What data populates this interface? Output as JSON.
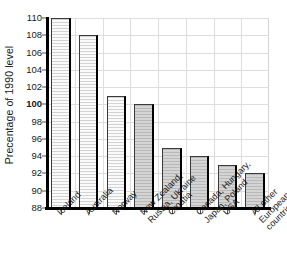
{
  "chart_data": {
    "type": "bar",
    "title": "",
    "xlabel": "",
    "ylabel": "Precentage of 1990 level",
    "ylim": [
      88,
      110
    ],
    "ytick_interval": 2,
    "yticks": [
      88,
      90,
      92,
      94,
      96,
      98,
      100,
      102,
      104,
      106,
      108,
      110
    ],
    "ytick_labels": [
      "88",
      "90",
      "92",
      "94",
      "96",
      "98",
      "100",
      "102",
      "104",
      "106",
      "108",
      "110"
    ],
    "emphasized_ytick": "100",
    "grid": true,
    "legend": "none",
    "categories": [
      "Iceland",
      "Australia",
      "Norway",
      "New Zealand,\nRussia, Ukraine",
      "Croatia",
      "Canada, Hungary,\nJapan, Poland",
      "USA",
      "All other\nEuropean\ncountries"
    ],
    "values": [
      110,
      108,
      101,
      100,
      95,
      94,
      93,
      92
    ],
    "bar_styles": [
      "light",
      "light",
      "light",
      "shaded",
      "shaded",
      "shaded",
      "shaded",
      "shaded"
    ],
    "colors": {
      "bar_light": "#fafafa",
      "bar_shaded": "#d4d4d4",
      "bar_edge": "#3a3a3a",
      "bar_shadow": "#000000",
      "grid": "#dddddd",
      "axis": "#000000",
      "text": "#1a1a1a",
      "background": "#ffffff"
    }
  }
}
